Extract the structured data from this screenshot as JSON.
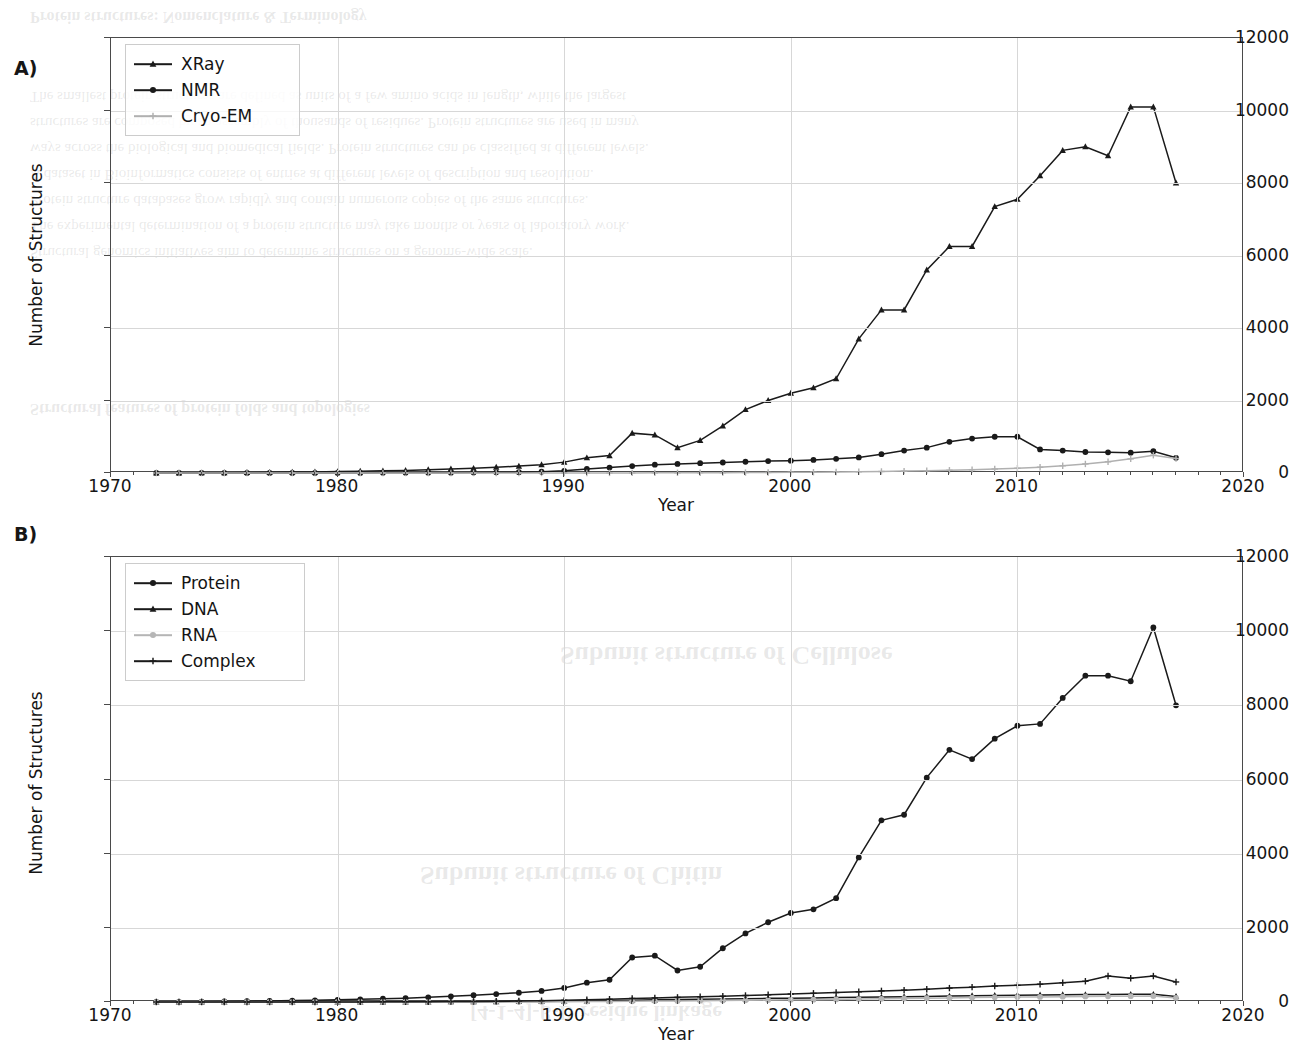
{
  "figure": {
    "background_color": "#ffffff",
    "panels": [
      {
        "letter": "A)",
        "xlabel": "Year",
        "ylabel": "Number of Structures"
      },
      {
        "letter": "B)",
        "xlabel": "Year",
        "ylabel": "Number of Structures"
      }
    ],
    "bleed_text": [
      "Protein structures: Nomenclature & Terminology",
      "The smallest protein structures are defined as units of a few amino acids in length, while the largest",
      "structures are composed by an assembly of thousands of residues. Protein structures are used in many",
      "ways across the biological and biomedical fields. Protein structures can be classified at different levels.",
      "A dataset in Bioinformatics consists of entries at different levels of description and resolution.",
      "Protein structure databases grow rapidly and contain numerous copies of the same structures.",
      "The experimental determination of a protein structure may take months or years of laboratory work.",
      "Structural genomics initiatives aim to determine structures on a genome-wide scale.",
      "Structural features of protein folds and topologies",
      "Subunit structure of Cellulose",
      "Subunit structure of Chitin",
      "[4-1-4]-β-D residue linkage"
    ]
  },
  "chart_data": [
    {
      "type": "line",
      "panel": "A",
      "title": "",
      "xlabel": "Year",
      "ylabel": "Number of Structures",
      "xlim": [
        1970,
        2020
      ],
      "ylim": [
        0,
        12000
      ],
      "xticks": [
        1970,
        1980,
        1990,
        2000,
        2010,
        2020
      ],
      "yticks": [
        0,
        2000,
        4000,
        6000,
        8000,
        10000,
        12000
      ],
      "grid": true,
      "legend_position": "upper left",
      "x": [
        1972,
        1973,
        1974,
        1975,
        1976,
        1977,
        1978,
        1979,
        1980,
        1981,
        1982,
        1983,
        1984,
        1985,
        1986,
        1987,
        1988,
        1989,
        1990,
        1991,
        1992,
        1993,
        1994,
        1995,
        1996,
        1997,
        1998,
        1999,
        2000,
        2001,
        2002,
        2003,
        2004,
        2005,
        2006,
        2007,
        2008,
        2009,
        2010,
        2011,
        2012,
        2013,
        2014,
        2015,
        2016,
        2017
      ],
      "series": [
        {
          "name": "XRay",
          "marker": "triangle",
          "color": "#1a1a1a",
          "values": [
            2,
            4,
            6,
            10,
            14,
            20,
            26,
            30,
            40,
            50,
            60,
            70,
            90,
            110,
            130,
            160,
            190,
            230,
            300,
            420,
            480,
            1100,
            1050,
            700,
            900,
            1300,
            1750,
            2000,
            2200,
            2350,
            2600,
            3700,
            4500,
            4500,
            5600,
            6250,
            6250,
            7350,
            7550,
            8200,
            8900,
            9000,
            8750,
            10100,
            10100,
            8000
          ]
        },
        {
          "name": "NMR",
          "marker": "circle",
          "color": "#1a1a1a",
          "values": [
            0,
            0,
            0,
            0,
            0,
            0,
            0,
            0,
            2,
            3,
            4,
            6,
            8,
            10,
            14,
            18,
            24,
            35,
            60,
            110,
            150,
            190,
            230,
            250,
            270,
            290,
            310,
            330,
            340,
            360,
            390,
            430,
            520,
            620,
            700,
            860,
            950,
            1000,
            1000,
            650,
            620,
            580,
            570,
            560,
            600,
            420
          ]
        },
        {
          "name": "Cryo-EM",
          "marker": "plus",
          "color": "#b0b0b0",
          "values": [
            0,
            0,
            0,
            0,
            0,
            0,
            0,
            0,
            0,
            0,
            0,
            0,
            0,
            0,
            0,
            0,
            0,
            0,
            0,
            1,
            2,
            3,
            4,
            5,
            7,
            9,
            12,
            15,
            18,
            22,
            28,
            34,
            42,
            52,
            62,
            76,
            92,
            110,
            130,
            160,
            200,
            250,
            310,
            390,
            490,
            400
          ]
        }
      ]
    },
    {
      "type": "line",
      "panel": "B",
      "title": "",
      "xlabel": "Year",
      "ylabel": "Number of Structures",
      "xlim": [
        1970,
        2020
      ],
      "ylim": [
        0,
        12000
      ],
      "xticks": [
        1970,
        1980,
        1990,
        2000,
        2010,
        2020
      ],
      "yticks": [
        0,
        2000,
        4000,
        6000,
        8000,
        10000,
        12000
      ],
      "grid": true,
      "legend_position": "upper left",
      "x": [
        1972,
        1973,
        1974,
        1975,
        1976,
        1977,
        1978,
        1979,
        1980,
        1981,
        1982,
        1983,
        1984,
        1985,
        1986,
        1987,
        1988,
        1989,
        1990,
        1991,
        1992,
        1993,
        1994,
        1995,
        1996,
        1997,
        1998,
        1999,
        2000,
        2001,
        2002,
        2003,
        2004,
        2005,
        2006,
        2007,
        2008,
        2009,
        2010,
        2011,
        2012,
        2013,
        2014,
        2015,
        2016,
        2017
      ],
      "series": [
        {
          "name": "Protein",
          "marker": "circle",
          "color": "#1a1a1a",
          "values": [
            4,
            6,
            10,
            16,
            22,
            30,
            38,
            46,
            58,
            72,
            88,
            104,
            126,
            152,
            182,
            214,
            250,
            300,
            380,
            520,
            600,
            1200,
            1250,
            850,
            950,
            1450,
            1850,
            2150,
            2400,
            2500,
            2800,
            3900,
            4900,
            5050,
            6050,
            6800,
            6550,
            7100,
            7450,
            7500,
            8200,
            8800,
            8800,
            8650,
            10100,
            8000
          ]
        },
        {
          "name": "DNA",
          "marker": "triangle",
          "color": "#1a1a1a",
          "values": [
            0,
            0,
            0,
            0,
            0,
            0,
            0,
            1,
            1,
            2,
            2,
            3,
            4,
            5,
            7,
            9,
            12,
            16,
            22,
            30,
            38,
            48,
            58,
            66,
            74,
            82,
            90,
            98,
            104,
            110,
            118,
            126,
            134,
            142,
            150,
            160,
            168,
            176,
            184,
            190,
            196,
            200,
            204,
            206,
            208,
            150
          ]
        },
        {
          "name": "RNA",
          "marker": "circle",
          "color": "#b5b5b5",
          "values": [
            0,
            0,
            0,
            0,
            0,
            0,
            0,
            0,
            0,
            0,
            1,
            1,
            2,
            2,
            3,
            4,
            5,
            7,
            9,
            12,
            16,
            20,
            25,
            30,
            35,
            40,
            46,
            52,
            58,
            64,
            70,
            78,
            86,
            94,
            102,
            110,
            118,
            126,
            132,
            138,
            144,
            150,
            154,
            158,
            160,
            110
          ]
        },
        {
          "name": "Complex",
          "marker": "plus",
          "color": "#1a1a1a",
          "values": [
            0,
            0,
            0,
            0,
            0,
            0,
            1,
            1,
            2,
            3,
            4,
            6,
            8,
            11,
            15,
            20,
            26,
            34,
            45,
            60,
            75,
            95,
            110,
            125,
            140,
            155,
            175,
            195,
            215,
            235,
            255,
            275,
            300,
            320,
            345,
            375,
            400,
            430,
            450,
            480,
            520,
            560,
            700,
            640,
            700,
            540
          ]
        }
      ]
    }
  ]
}
